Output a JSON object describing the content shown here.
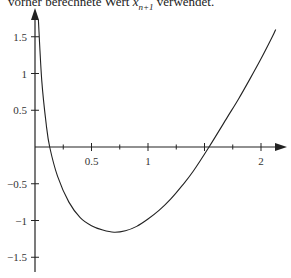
{
  "caption": {
    "prefix": "vorher berechnete Wert ",
    "var": "x",
    "sub": "n+1",
    "suffix": " verwendet."
  },
  "chart_data": {
    "type": "line",
    "title": "",
    "xlabel": "",
    "ylabel": "",
    "xlim": [
      0,
      2.2
    ],
    "ylim": [
      -1.7,
      1.75
    ],
    "x_ticks": [
      "0.5",
      "1",
      "2"
    ],
    "y_ticks": [
      "1.5",
      "1",
      "0.5",
      "-0.5",
      "-1",
      "-1.5"
    ],
    "grid": false,
    "series": [
      {
        "name": "f(x)",
        "x": [
          0.03,
          0.06,
          0.1,
          0.13,
          0.2,
          0.3,
          0.4,
          0.5,
          0.6,
          0.7,
          0.8,
          0.9,
          1.0,
          1.1,
          1.2,
          1.3,
          1.4,
          1.54,
          1.7,
          1.8,
          1.9,
          2.0,
          2.1,
          2.13
        ],
        "y": [
          1.73,
          0.9,
          0.3,
          0.0,
          -0.4,
          -0.75,
          -0.96,
          -1.07,
          -1.13,
          -1.16,
          -1.14,
          -1.08,
          -0.98,
          -0.86,
          -0.71,
          -0.53,
          -0.33,
          0.0,
          0.4,
          0.65,
          0.92,
          1.2,
          1.5,
          1.6
        ]
      }
    ]
  }
}
